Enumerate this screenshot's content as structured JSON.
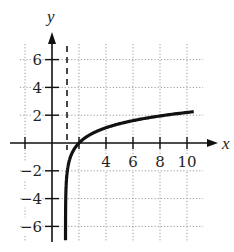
{
  "chart_data": {
    "type": "line",
    "title": "",
    "xlabel": "x",
    "ylabel": "y",
    "xlim": [
      -2.5,
      10.5
    ],
    "ylim": [
      -7,
      7
    ],
    "grid": true,
    "grid_style": "dotted",
    "x_ticks": [
      4,
      6,
      8,
      10
    ],
    "x_tick_labels": [
      "4",
      "6",
      "8",
      "10"
    ],
    "y_ticks": [
      6,
      4,
      2,
      -2,
      -4,
      -6
    ],
    "y_tick_labels": [
      "6",
      "4",
      "2",
      "−2",
      "−4",
      "−6"
    ],
    "asymptote": {
      "type": "vertical",
      "x": 1,
      "style": "dashed"
    },
    "series": [
      {
        "name": "y = ln(x - 1)",
        "x": [
          1.0009,
          1.002,
          1.01,
          1.05,
          1.1,
          1.2,
          1.4,
          1.7,
          2,
          2.5,
          3,
          4,
          5,
          6,
          7,
          8,
          9,
          10,
          10.5
        ],
        "y": [
          -7.0,
          -6.2,
          -4.6,
          -3.0,
          -2.3,
          -1.61,
          -0.92,
          -0.36,
          0,
          0.41,
          0.69,
          1.1,
          1.39,
          1.61,
          1.79,
          1.95,
          2.08,
          2.2,
          2.25
        ]
      }
    ]
  }
}
